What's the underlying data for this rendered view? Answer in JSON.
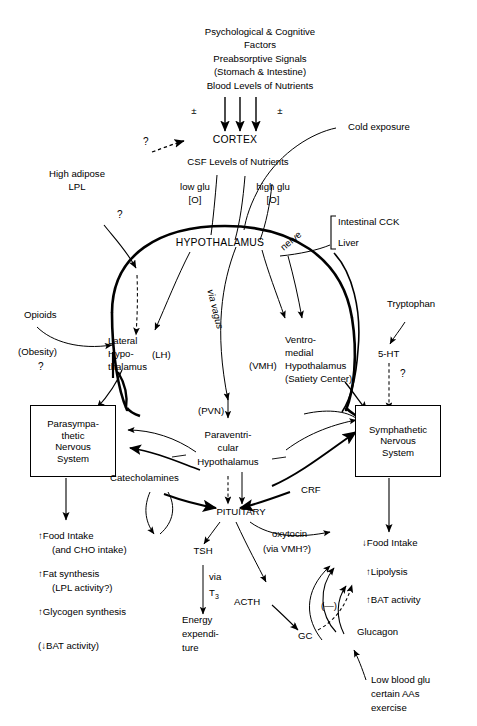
{
  "diagram": {
    "type": "flow-diagram",
    "background": "#ffffff",
    "line_color": "#000000"
  },
  "inputs_top": {
    "line1": "Psychological & Cognitive",
    "line2": "Factors",
    "line3": "Preabsorptive Signals",
    "line4": "(Stomach & Intestine)",
    "line5": "Blood Levels of Nutrients",
    "sign_left": "±",
    "sign_right": "±"
  },
  "nodes": {
    "cortex": "CORTEX",
    "csf": "CSF Levels of Nutrients",
    "question_cortex": "?",
    "cold_exposure": "Cold exposure",
    "high_adipose_l1": "High adipose",
    "high_adipose_l2": "LPL",
    "question_lpl": "?",
    "low_glu_l1": "low glu",
    "low_glu_l2": "[O]",
    "high_glu_l1": "high glu",
    "high_glu_l2": "[O]",
    "hypothalamus": "HYPOTHALAMUS",
    "nerve": "nerve",
    "intestinal_cck": "Intestinal CCK",
    "liver": "Liver",
    "opioids": "Opioids",
    "obesity": "(Obesity)",
    "question_obesity": "?",
    "lateral_l1": "Lateral",
    "lateral_l2": "Hypo-",
    "lateral_l3": "thalamus",
    "lh_tag": "(LH)",
    "via_vagus": "via vagus",
    "vmh_tag": "(VMH)",
    "ventromedial_l1": "Ventro-",
    "ventromedial_l2": "medial",
    "ventromedial_l3": "Hypothalamus",
    "ventromedial_l4": "(Satiety Center)",
    "tryptophan": "Tryptophan",
    "five_ht": "5-HT",
    "question_5ht": "?",
    "parasympathetic_l1": "Parasympa-",
    "parasympathetic_l2": "thetic",
    "parasympathetic_l3": "Nervous",
    "parasympathetic_l4": "System",
    "pvn_tag": "(PVN)",
    "paraventricular_l1": "Paraventri-",
    "paraventricular_l2": "cular",
    "paraventricular_l3": "Hypothalamus",
    "sympathetic_l1": "Symphathetic",
    "sympathetic_l2": "Nervous",
    "sympathetic_l3": "System",
    "catecholamines": "Catecholamines",
    "crf": "CRF",
    "pituitary": "PITUITARY",
    "oxytocin_l1": "oxytocin",
    "oxytocin_l2": "(via VMH?)",
    "food_intake_up_l1": "↑Food Intake",
    "food_intake_up_l2": "(and CHO intake)",
    "fat_synthesis_l1": "↑Fat synthesis",
    "fat_synthesis_l2": "(LPL activity?)",
    "glycogen_synthesis": "↑Glycogen synthesis",
    "bat_down": "(↓BAT activity)",
    "food_intake_down": "↓Food Intake",
    "lipolysis": "↑Lipolysis",
    "bat_activity": "↑BAT activity",
    "tsh": "TSH",
    "via": "via",
    "t3": "T",
    "t3_sub": "3",
    "energy_l1": "Energy",
    "energy_l2": "expendi-",
    "energy_l3": "ture",
    "acth": "ACTH",
    "gc": "GC",
    "minus": "(—)",
    "glucagon": "Glucagon",
    "low_blood_l1": "Low blood glu",
    "low_blood_l2": "certain AAs",
    "low_blood_l3": "exercise"
  }
}
